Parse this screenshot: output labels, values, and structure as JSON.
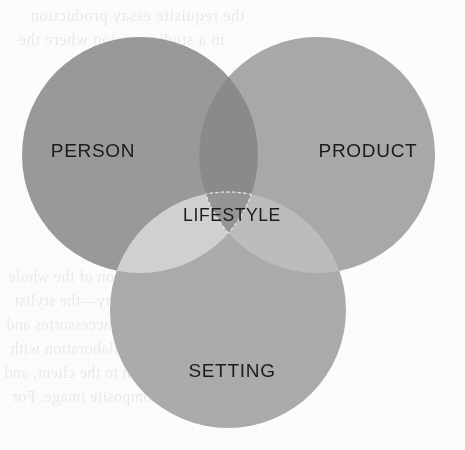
{
  "page": {
    "background_color": "#fdfdfc",
    "width": 465,
    "height": 450
  },
  "diagram": {
    "type": "venn",
    "set_count": 3,
    "title": "",
    "sets": [
      {
        "id": "person",
        "label": "PERSON",
        "position": "top-left",
        "center_x": 140,
        "center_y": 155,
        "radius": 118,
        "fill": "#9a9a9a",
        "label_x": 93,
        "label_y": 152
      },
      {
        "id": "product",
        "label": "PRODUCT",
        "position": "top-right",
        "center_x": 317,
        "center_y": 155,
        "radius": 118,
        "fill": "#a9a9a9",
        "label_x": 368,
        "label_y": 152
      },
      {
        "id": "setting",
        "label": "SETTING",
        "position": "bottom-center",
        "center_x": 228,
        "center_y": 310,
        "radius": 118,
        "fill": "#acacac",
        "label_x": 232,
        "label_y": 372
      }
    ],
    "intersections": [
      {
        "id": "person-product",
        "sets": [
          "person",
          "product"
        ],
        "label": "",
        "fill": "#8b8b8b"
      },
      {
        "id": "person-setting",
        "sets": [
          "person",
          "setting"
        ],
        "label": "",
        "fill": "#d2d2d2"
      },
      {
        "id": "product-setting",
        "sets": [
          "product",
          "setting"
        ],
        "label": "",
        "fill": "#bdbdbd"
      }
    ],
    "center_intersection": {
      "id": "lifestyle",
      "sets": [
        "person",
        "product",
        "setting"
      ],
      "label": "LIFESTYLE",
      "fill": "#969696",
      "outline_style": "dashed",
      "outline_color": "#e8e8e8",
      "label_x": 232,
      "label_y": 216
    },
    "colors": {
      "person": "#9a9a9a",
      "product": "#a9a9a9",
      "setting": "#acacac",
      "person_product": "#8b8b8b",
      "person_setting": "#d2d2d2",
      "product_setting": "#bdbdbd",
      "center": "#969696",
      "label_text": "#1b1b1b",
      "dashed_outline": "#e8e8e8"
    }
  },
  "bleed_through": {
    "description": "faint mirrored show-through text from the reverse side of the scanned page",
    "lines": [
      {
        "x": 30,
        "y": 6,
        "size": 17,
        "text": "the requisite essay production"
      },
      {
        "x": 18,
        "y": 30,
        "size": 17,
        "text": "in a studio session where the"
      },
      {
        "x": 8,
        "y": 268,
        "size": 16,
        "text": "consideration of the whole"
      },
      {
        "x": 14,
        "y": 292,
        "size": 16,
        "text": "a personality—the stylist"
      },
      {
        "x": 6,
        "y": 316,
        "size": 16,
        "text": "includes the accessories and"
      },
      {
        "x": 10,
        "y": 340,
        "size": 16,
        "text": "the same collaboration with"
      },
      {
        "x": 4,
        "y": 364,
        "size": 16,
        "text": "the session to the client, and"
      },
      {
        "x": 12,
        "y": 388,
        "size": 16,
        "text": "the final composite image. For"
      }
    ]
  }
}
